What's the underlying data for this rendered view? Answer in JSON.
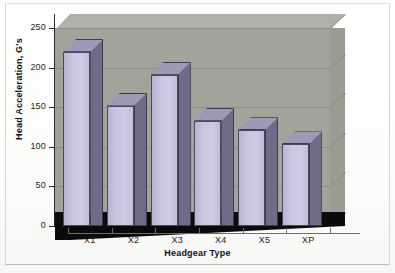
{
  "chart_data": {
    "type": "bar",
    "title": "",
    "categories": [
      "X1",
      "X2",
      "X3",
      "X4",
      "X5",
      "XP"
    ],
    "values": [
      220,
      152,
      191,
      133,
      121,
      103
    ],
    "xlabel": "Headgear Type",
    "ylabel": "Head Acceleration, G's",
    "ylim": [
      0,
      250
    ],
    "yticks": [
      0,
      50,
      100,
      150,
      200,
      250
    ],
    "ytick_labels": [
      "0",
      "50",
      "100",
      "150",
      "200",
      "250"
    ],
    "grid": true,
    "legend": false,
    "style": "3d-column",
    "series": [
      {
        "name": "Head Acceleration",
        "values": [
          220,
          152,
          191,
          133,
          121,
          103
        ]
      }
    ]
  },
  "colors": {
    "bar_front": "#c9c7e0",
    "bar_side": "#6e6c88",
    "bar_top": "#9c9ab6",
    "bar_edge": "#4a4860",
    "wall_back": "#a3a399",
    "wall_top": "#b0b0a6",
    "wall_right": "#9b9b91",
    "floor": "#0a0a0a",
    "gridline": "#8f8f86",
    "axis": "#2b2b2b",
    "text": "#111111",
    "page_background": "#ffffff"
  }
}
